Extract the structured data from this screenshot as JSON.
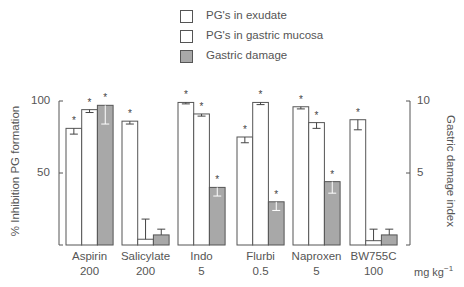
{
  "chart_data": {
    "type": "bar",
    "title": "",
    "categories": [
      "Aspirin 200",
      "Salicylate 200",
      "Indo 5",
      "Flurbi 0.5",
      "Naproxen 5",
      "BW755C 100"
    ],
    "category_names": [
      "Aspirin",
      "Salicylate",
      "Indo",
      "Flurbi",
      "Naproxen",
      "BW755C"
    ],
    "doses": [
      "200",
      "200",
      "5",
      "0.5",
      "5",
      "100"
    ],
    "dose_unit": "mg kg",
    "dose_unit_exp": "−1",
    "xlabel": "",
    "ylabel": "% Inhibition PG formation",
    "ylabel_right": "Gastric damage index",
    "ylim": [
      0,
      100
    ],
    "ylim_right": [
      0,
      10
    ],
    "yticks": [
      "100",
      "50"
    ],
    "yticks_right": [
      "10",
      "5"
    ],
    "legend_position": "top-center",
    "grid": false,
    "series": [
      {
        "name": "PG's in exudate",
        "axis": "left",
        "color": "#ffffff",
        "values": [
          81,
          86,
          99,
          75,
          96,
          87
        ],
        "errors": [
          4,
          2,
          1,
          4,
          1.5,
          7
        ],
        "significant": [
          true,
          true,
          true,
          true,
          true,
          true
        ]
      },
      {
        "name": "PG's in gastric mucosa",
        "axis": "left",
        "color": "#ffffff",
        "values": [
          94,
          4,
          91,
          99,
          85,
          3
        ],
        "errors": [
          2,
          14,
          1.5,
          1.5,
          4,
          8
        ],
        "significant": [
          true,
          false,
          true,
          true,
          true,
          false
        ]
      },
      {
        "name": "Gastric damage",
        "axis": "right",
        "color": "#a8a8a8",
        "values": [
          9.7,
          0.7,
          4.0,
          3.0,
          4.4,
          0.7
        ],
        "errors": [
          1.3,
          0.4,
          0.6,
          0.6,
          0.8,
          0.4
        ],
        "significant": [
          true,
          false,
          true,
          true,
          true,
          false
        ]
      }
    ],
    "annotations": [
      "*"
    ]
  },
  "legend": [
    {
      "label": "PG's in exudate",
      "color": "#ffffff"
    },
    {
      "label": "PG's in gastric mucosa",
      "color": "#ffffff"
    },
    {
      "label": "Gastric damage",
      "color": "#a8a8a8"
    }
  ]
}
